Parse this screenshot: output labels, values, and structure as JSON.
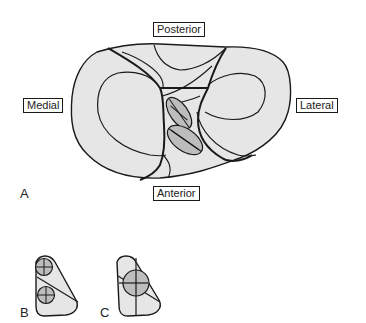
{
  "figure": {
    "orientation_labels": {
      "posterior": "Posterior",
      "medial": "Medial",
      "lateral": "Lateral",
      "anterior": "Anterior"
    },
    "panels": [
      {
        "id": "A",
        "label": "A",
        "description": "Superior view of tibial plateau with two hatched tunnel ellipses in the intercondylar region"
      },
      {
        "id": "B",
        "label": "B",
        "description": "Triangular footprint with two separate circular tunnels, each with crosshairs, separated by a diagonal line"
      },
      {
        "id": "C",
        "label": "C",
        "description": "Triangular footprint with a single larger circular tunnel with crosshairs"
      }
    ],
    "colors": {
      "outline": "#1a1a1a",
      "fill_light": "#e6e6e6",
      "fill_tunnel": "#bdbdbd",
      "background": "#ffffff"
    }
  }
}
